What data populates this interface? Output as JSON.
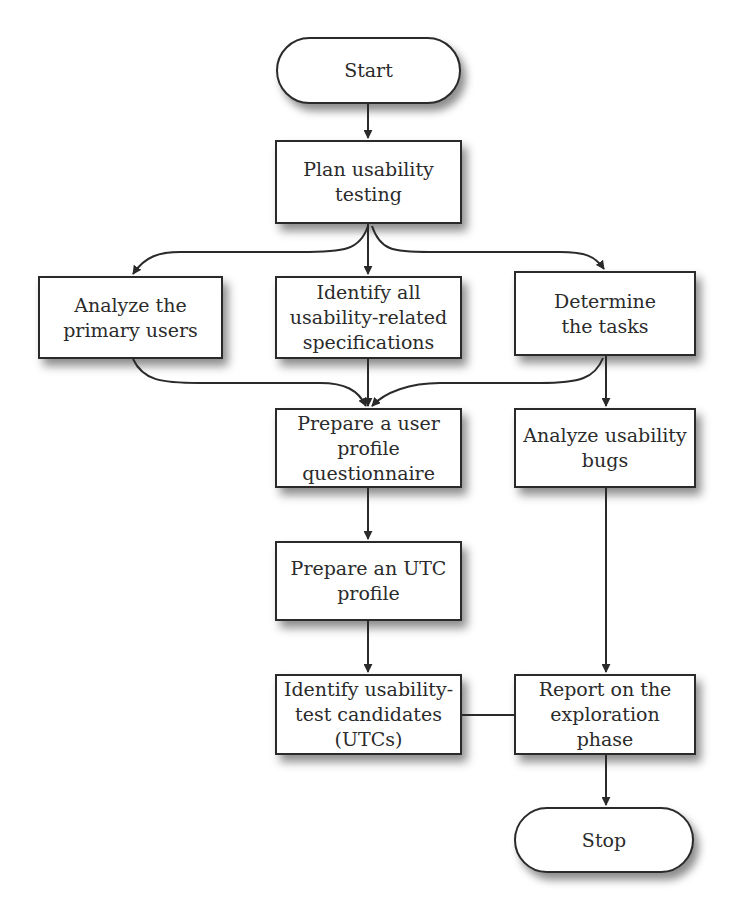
{
  "diagram": {
    "type": "flowchart",
    "nodes": [
      {
        "id": "start",
        "label": "Start",
        "shape": "terminal"
      },
      {
        "id": "plan",
        "label": "Plan usability\ntesting",
        "shape": "process"
      },
      {
        "id": "analyze_users",
        "label": "Analyze the\nprimary users",
        "shape": "process"
      },
      {
        "id": "identify_specs",
        "label": "Identify all\nusability-related\nspecifications",
        "shape": "process"
      },
      {
        "id": "determine_tasks",
        "label": "Determine\nthe tasks",
        "shape": "process"
      },
      {
        "id": "prepare_questionnaire",
        "label": "Prepare a user\nprofile\nquestionnaire",
        "shape": "process"
      },
      {
        "id": "analyze_bugs",
        "label": "Analyze usability\nbugs",
        "shape": "process"
      },
      {
        "id": "prepare_utc_profile",
        "label": "Prepare an UTC\nprofile",
        "shape": "process"
      },
      {
        "id": "identify_utcs",
        "label": "Identify usability-\ntest candidates\n(UTCs)",
        "shape": "process"
      },
      {
        "id": "report",
        "label": "Report on the\nexploration phase",
        "shape": "process"
      },
      {
        "id": "stop",
        "label": "Stop",
        "shape": "terminal"
      }
    ],
    "edges": [
      {
        "from": "start",
        "to": "plan",
        "arrow": true
      },
      {
        "from": "plan",
        "to": "analyze_users",
        "arrow": true
      },
      {
        "from": "plan",
        "to": "identify_specs",
        "arrow": true
      },
      {
        "from": "plan",
        "to": "determine_tasks",
        "arrow": true
      },
      {
        "from": "analyze_users",
        "to": "prepare_questionnaire",
        "arrow": true
      },
      {
        "from": "identify_specs",
        "to": "prepare_questionnaire",
        "arrow": true
      },
      {
        "from": "determine_tasks",
        "to": "prepare_questionnaire",
        "arrow": true
      },
      {
        "from": "determine_tasks",
        "to": "analyze_bugs",
        "arrow": true
      },
      {
        "from": "prepare_questionnaire",
        "to": "prepare_utc_profile",
        "arrow": true
      },
      {
        "from": "prepare_utc_profile",
        "to": "identify_utcs",
        "arrow": true
      },
      {
        "from": "analyze_bugs",
        "to": "report",
        "arrow": true
      },
      {
        "from": "identify_utcs",
        "to": "report",
        "arrow": false
      },
      {
        "from": "report",
        "to": "stop",
        "arrow": true
      }
    ]
  },
  "colors": {
    "stroke": "#2a2a2a",
    "fill": "#ffffff",
    "text": "#2b2b2b"
  }
}
